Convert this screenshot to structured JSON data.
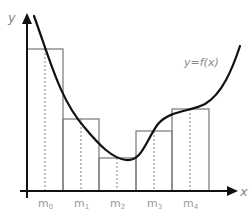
{
  "diagram": {
    "axes": {
      "x_label": "x",
      "y_label": "y",
      "origin": [
        27,
        191
      ],
      "x_end": 236,
      "y_end": 12
    },
    "curve_label": "y=f(x)",
    "curve_path": "M 34 16 C 50 60, 60 100, 85 128 C 100 146, 112 158, 126 160 C 142 162, 146 140, 158 124 C 170 110, 190 112, 205 104 C 222 94, 232 70, 240 46",
    "colors": {
      "curve": "#111111",
      "axis": "#111111",
      "rect_stroke": "#808080",
      "dotted": "#808080",
      "label": "#8a8a8a"
    },
    "rectangles": [
      {
        "x0": 27,
        "x1": 63,
        "top": 49,
        "mid": 45,
        "label": "m",
        "sub": "0"
      },
      {
        "x0": 63,
        "x1": 99,
        "top": 119,
        "mid": 81,
        "label": "m",
        "sub": "1"
      },
      {
        "x0": 99,
        "x1": 136,
        "top": 158,
        "mid": 117,
        "label": "m",
        "sub": "2"
      },
      {
        "x0": 136,
        "x1": 172,
        "top": 131,
        "mid": 154,
        "label": "m",
        "sub": "3"
      },
      {
        "x0": 172,
        "x1": 209,
        "top": 109,
        "mid": 190,
        "label": "m",
        "sub": "4"
      }
    ]
  }
}
